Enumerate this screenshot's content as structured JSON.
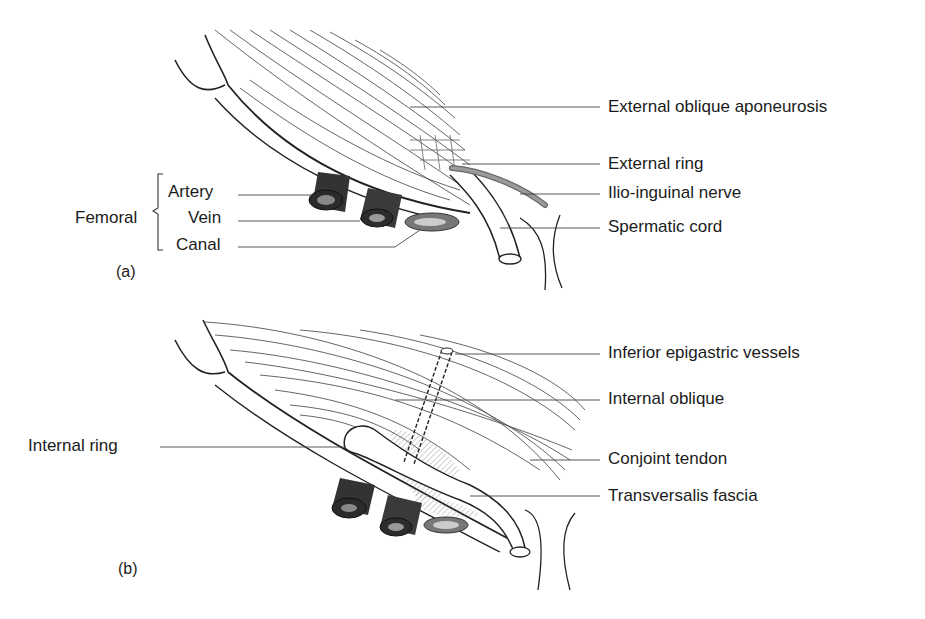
{
  "figure": {
    "panels": [
      {
        "id": "a",
        "tag": "(a)",
        "labels": {
          "external_oblique_aponeurosis": "External oblique aponeurosis",
          "external_ring": "External ring",
          "ilio_inguinal_nerve": "Ilio-inguinal nerve",
          "spermatic_cord": "Spermatic cord",
          "femoral_group": "Femoral",
          "artery": "Artery",
          "vein": "Vein",
          "canal": "Canal"
        }
      },
      {
        "id": "b",
        "tag": "(b)",
        "labels": {
          "inferior_epigastric_vessels": "Inferior epigastric vessels",
          "internal_oblique": "Internal oblique",
          "internal_ring": "Internal ring",
          "conjoint_tendon": "Conjoint tendon",
          "transversalis_fascia": "Transversalis fascia"
        }
      }
    ]
  }
}
